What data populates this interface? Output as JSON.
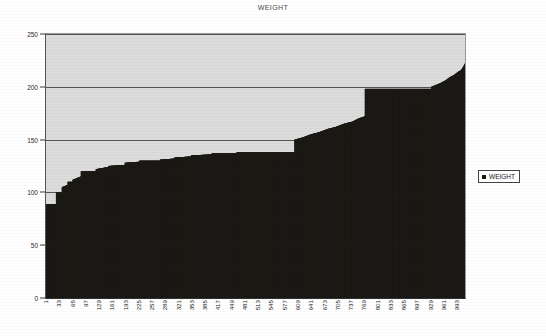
{
  "chart_data": {
    "type": "bar",
    "title": "WEIGHT",
    "xlabel": "",
    "ylabel": "",
    "ylim": [
      0,
      250
    ],
    "y_ticks": [
      0,
      50,
      100,
      150,
      200,
      250
    ],
    "grid": true,
    "grid_axis": "y",
    "legend": {
      "position": "right",
      "entries": [
        "WEIGHT"
      ]
    },
    "series_name": "WEIGHT",
    "series_color": "#1c1a16",
    "plot_background": "#dcdcdc",
    "x_tick_labels": [
      "1",
      "33",
      "65",
      "97",
      "129",
      "161",
      "193",
      "225",
      "257",
      "289",
      "321",
      "353",
      "385",
      "417",
      "449",
      "481",
      "513",
      "545",
      "577",
      "609",
      "641",
      "673",
      "705",
      "737",
      "769",
      "801",
      "833",
      "865",
      "897",
      "929",
      "961",
      "993"
    ],
    "x_tick_interval": 32,
    "x_first_index": 1,
    "x_last_index": 1012,
    "n_points": 1012,
    "note": "Sorted (ascending) bar chart of WEIGHT for every record; staircase plateaus correspond to commonly reported round weights.",
    "value_min": 89,
    "value_max": 222,
    "profile": [
      {
        "x": 1,
        "y": 89
      },
      {
        "x": 24,
        "y": 89
      },
      {
        "x": 25,
        "y": 100
      },
      {
        "x": 38,
        "y": 100
      },
      {
        "x": 39,
        "y": 105
      },
      {
        "x": 52,
        "y": 107
      },
      {
        "x": 53,
        "y": 110
      },
      {
        "x": 64,
        "y": 110
      },
      {
        "x": 65,
        "y": 112
      },
      {
        "x": 84,
        "y": 115
      },
      {
        "x": 85,
        "y": 120
      },
      {
        "x": 120,
        "y": 120
      },
      {
        "x": 121,
        "y": 122
      },
      {
        "x": 150,
        "y": 124
      },
      {
        "x": 151,
        "y": 125
      },
      {
        "x": 190,
        "y": 126
      },
      {
        "x": 191,
        "y": 128
      },
      {
        "x": 225,
        "y": 129
      },
      {
        "x": 226,
        "y": 130
      },
      {
        "x": 275,
        "y": 130
      },
      {
        "x": 276,
        "y": 131
      },
      {
        "x": 310,
        "y": 132
      },
      {
        "x": 311,
        "y": 133
      },
      {
        "x": 350,
        "y": 134
      },
      {
        "x": 351,
        "y": 135
      },
      {
        "x": 400,
        "y": 136
      },
      {
        "x": 401,
        "y": 137
      },
      {
        "x": 460,
        "y": 137
      },
      {
        "x": 461,
        "y": 138
      },
      {
        "x": 600,
        "y": 138
      },
      {
        "x": 601,
        "y": 150
      },
      {
        "x": 620,
        "y": 152
      },
      {
        "x": 640,
        "y": 155
      },
      {
        "x": 660,
        "y": 157
      },
      {
        "x": 680,
        "y": 160
      },
      {
        "x": 700,
        "y": 162
      },
      {
        "x": 720,
        "y": 165
      },
      {
        "x": 740,
        "y": 167
      },
      {
        "x": 755,
        "y": 170
      },
      {
        "x": 770,
        "y": 172
      },
      {
        "x": 771,
        "y": 198
      },
      {
        "x": 820,
        "y": 198
      },
      {
        "x": 900,
        "y": 198
      },
      {
        "x": 930,
        "y": 198
      },
      {
        "x": 931,
        "y": 200
      },
      {
        "x": 950,
        "y": 203
      },
      {
        "x": 965,
        "y": 206
      },
      {
        "x": 975,
        "y": 209
      },
      {
        "x": 985,
        "y": 211
      },
      {
        "x": 995,
        "y": 214
      },
      {
        "x": 1003,
        "y": 216
      },
      {
        "x": 1008,
        "y": 219
      },
      {
        "x": 1012,
        "y": 222
      }
    ]
  },
  "legend": {
    "label": "WEIGHT"
  }
}
